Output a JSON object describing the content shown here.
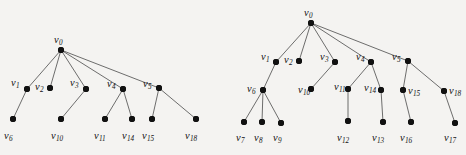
{
  "figure": {
    "background_color": "#f4f3f1",
    "node_color": "#111111",
    "edge_color": "#4a4a4a",
    "label_color": "#121212",
    "node_radius": 3,
    "width": 466,
    "height": 155,
    "trees": [
      {
        "name": "left-tree",
        "nodes": [
          {
            "id": "v0",
            "label": "v",
            "sub": "0",
            "x": 61,
            "y": 50,
            "lx": 54,
            "ly": 35
          },
          {
            "id": "v1",
            "label": "v",
            "sub": "1",
            "x": 27,
            "y": 89,
            "lx": 11,
            "ly": 78
          },
          {
            "id": "v2",
            "label": "v",
            "sub": "2",
            "x": 50,
            "y": 88,
            "lx": 35,
            "ly": 82
          },
          {
            "id": "v3",
            "label": "v",
            "sub": "3",
            "x": 86,
            "y": 89,
            "lx": 70,
            "ly": 78
          },
          {
            "id": "v4",
            "label": "v",
            "sub": "4",
            "x": 123,
            "y": 89,
            "lx": 107,
            "ly": 79
          },
          {
            "id": "v5",
            "label": "v",
            "sub": "5",
            "x": 159,
            "y": 88,
            "lx": 143,
            "ly": 79
          },
          {
            "id": "v6",
            "label": "v",
            "sub": "6",
            "x": 13,
            "y": 119,
            "lx": 4,
            "ly": 131
          },
          {
            "id": "v10",
            "label": "v",
            "sub": "10",
            "x": 61,
            "y": 119,
            "lx": 51,
            "ly": 131
          },
          {
            "id": "v11",
            "label": "v",
            "sub": "11",
            "x": 105,
            "y": 119,
            "lx": 94,
            "ly": 131
          },
          {
            "id": "v14",
            "label": "v",
            "sub": "14",
            "x": 132,
            "y": 119,
            "lx": 122,
            "ly": 131
          },
          {
            "id": "v15",
            "label": "v",
            "sub": "15",
            "x": 152,
            "y": 119,
            "lx": 142,
            "ly": 131
          },
          {
            "id": "v18",
            "label": "v",
            "sub": "18",
            "x": 196,
            "y": 119,
            "lx": 185,
            "ly": 131
          }
        ],
        "edges": [
          [
            "v0",
            "v1"
          ],
          [
            "v0",
            "v2"
          ],
          [
            "v0",
            "v3"
          ],
          [
            "v0",
            "v4"
          ],
          [
            "v0",
            "v5"
          ],
          [
            "v1",
            "v6"
          ],
          [
            "v3",
            "v10"
          ],
          [
            "v4",
            "v11"
          ],
          [
            "v4",
            "v14"
          ],
          [
            "v5",
            "v15"
          ],
          [
            "v5",
            "v18"
          ]
        ]
      },
      {
        "name": "right-tree",
        "nodes": [
          {
            "id": "v0",
            "label": "v",
            "sub": "0",
            "x": 311,
            "y": 23,
            "lx": 304,
            "ly": 8
          },
          {
            "id": "v1",
            "label": "v",
            "sub": "1",
            "x": 276,
            "y": 62,
            "lx": 261,
            "ly": 52
          },
          {
            "id": "v2",
            "label": "v",
            "sub": "2",
            "x": 299,
            "y": 61,
            "lx": 284,
            "ly": 55
          },
          {
            "id": "v3",
            "label": "v",
            "sub": "3",
            "x": 335,
            "y": 62,
            "lx": 320,
            "ly": 52
          },
          {
            "id": "v4",
            "label": "v",
            "sub": "4",
            "x": 371,
            "y": 62,
            "lx": 356,
            "ly": 52
          },
          {
            "id": "v5",
            "label": "v",
            "sub": "5",
            "x": 408,
            "y": 61,
            "lx": 392,
            "ly": 52
          },
          {
            "id": "v6",
            "label": "v",
            "sub": "6",
            "x": 263,
            "y": 90,
            "lx": 247,
            "ly": 84
          },
          {
            "id": "v10",
            "label": "v",
            "sub": "10",
            "x": 311,
            "y": 89,
            "lx": 298,
            "ly": 85
          },
          {
            "id": "v11",
            "label": "v",
            "sub": "11",
            "x": 348,
            "y": 89,
            "lx": 334,
            "ly": 82
          },
          {
            "id": "v14",
            "label": "v",
            "sub": "14",
            "x": 381,
            "y": 90,
            "lx": 364,
            "ly": 83
          },
          {
            "id": "v15",
            "label": "v",
            "sub": "15",
            "x": 403,
            "y": 90,
            "lx": 408,
            "ly": 86
          },
          {
            "id": "v18",
            "label": "v",
            "sub": "18",
            "x": 444,
            "y": 91,
            "lx": 449,
            "ly": 86
          },
          {
            "id": "v7",
            "label": "v",
            "sub": "7",
            "x": 244,
            "y": 122,
            "lx": 236,
            "ly": 133
          },
          {
            "id": "v8",
            "label": "v",
            "sub": "8",
            "x": 262,
            "y": 122,
            "lx": 254,
            "ly": 133
          },
          {
            "id": "v9",
            "label": "v",
            "sub": "9",
            "x": 281,
            "y": 123,
            "lx": 273,
            "ly": 133
          },
          {
            "id": "v12",
            "label": "v",
            "sub": "12",
            "x": 348,
            "y": 121,
            "lx": 337,
            "ly": 133
          },
          {
            "id": "v13",
            "label": "v",
            "sub": "13",
            "x": 383,
            "y": 122,
            "lx": 372,
            "ly": 133
          },
          {
            "id": "v16",
            "label": "v",
            "sub": "16",
            "x": 411,
            "y": 122,
            "lx": 400,
            "ly": 133
          },
          {
            "id": "v17",
            "label": "v",
            "sub": "17",
            "x": 455,
            "y": 123,
            "lx": 444,
            "ly": 133
          }
        ],
        "edges": [
          [
            "v0",
            "v1"
          ],
          [
            "v0",
            "v2"
          ],
          [
            "v0",
            "v3"
          ],
          [
            "v0",
            "v4"
          ],
          [
            "v0",
            "v5"
          ],
          [
            "v1",
            "v6"
          ],
          [
            "v3",
            "v10"
          ],
          [
            "v6",
            "v7"
          ],
          [
            "v6",
            "v8"
          ],
          [
            "v6",
            "v9"
          ],
          [
            "v4",
            "v11"
          ],
          [
            "v4",
            "v14"
          ],
          [
            "v11",
            "v12"
          ],
          [
            "v14",
            "v13"
          ],
          [
            "v5",
            "v15"
          ],
          [
            "v5",
            "v18"
          ],
          [
            "v15",
            "v16"
          ],
          [
            "v18",
            "v17"
          ]
        ]
      }
    ]
  }
}
